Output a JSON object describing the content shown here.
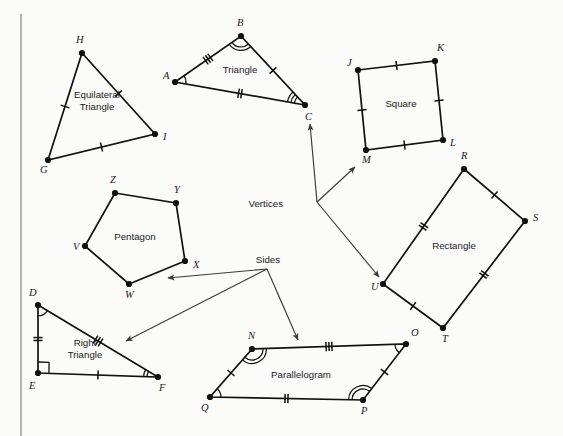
{
  "figure": {
    "background_color": "#fbfbfa",
    "ink_color": "#111111",
    "leader_color": "#3a3a3a",
    "border_rule_color": "#8c8c8c"
  },
  "shapes": [
    {
      "id": "equilateral-triangle",
      "name": "Equilateral Triangle",
      "label_lines": [
        "Equilateral",
        "Triangle"
      ],
      "label_pos": {
        "x": 97,
        "y": 104
      },
      "vertices": [
        {
          "label": "H",
          "x": 82,
          "y": 53,
          "lx": 76,
          "ly": 43
        },
        {
          "label": "I",
          "x": 155,
          "y": 134,
          "lx": 163,
          "ly": 140
        },
        {
          "label": "G",
          "x": 48,
          "y": 160,
          "lx": 40,
          "ly": 173
        }
      ],
      "side_ticks": [
        1,
        1,
        1
      ],
      "angle_marks": []
    },
    {
      "id": "triangle",
      "name": "Triangle",
      "label_lines": [
        "Triangle"
      ],
      "label_pos": {
        "x": 240,
        "y": 73
      },
      "vertices": [
        {
          "label": "A",
          "x": 175,
          "y": 82,
          "lx": 163,
          "ly": 79
        },
        {
          "label": "B",
          "x": 241,
          "y": 36,
          "lx": 237,
          "ly": 26
        },
        {
          "label": "C",
          "x": 305,
          "y": 105,
          "lx": 305,
          "ly": 120
        }
      ],
      "side_ticks": [
        3,
        1,
        2
      ],
      "angle_marks": [
        {
          "at": "A",
          "arcs": 1
        },
        {
          "at": "B",
          "arcs": 2
        },
        {
          "at": "C",
          "arcs": 3
        }
      ]
    },
    {
      "id": "square",
      "name": "Square",
      "label_lines": [
        "Square"
      ],
      "label_pos": {
        "x": 401,
        "y": 107
      },
      "vertices": [
        {
          "label": "J",
          "x": 358,
          "y": 70,
          "lx": 347,
          "ly": 66
        },
        {
          "label": "K",
          "x": 435,
          "y": 61,
          "lx": 437,
          "ly": 51
        },
        {
          "label": "L",
          "x": 443,
          "y": 140,
          "lx": 450,
          "ly": 146
        },
        {
          "label": "M",
          "x": 366,
          "y": 150,
          "lx": 362,
          "ly": 163
        }
      ],
      "side_ticks": [
        1,
        1,
        1,
        1
      ],
      "angle_marks": []
    },
    {
      "id": "rectangle",
      "name": "Rectangle",
      "label_lines": [
        "Rectangle"
      ],
      "label_pos": {
        "x": 454,
        "y": 249
      },
      "vertices": [
        {
          "label": "R",
          "x": 464,
          "y": 169,
          "lx": 461,
          "ly": 159
        },
        {
          "label": "S",
          "x": 525,
          "y": 221,
          "lx": 533,
          "ly": 221
        },
        {
          "label": "T",
          "x": 443,
          "y": 328,
          "lx": 442,
          "ly": 342
        },
        {
          "label": "U",
          "x": 383,
          "y": 284,
          "lx": 371,
          "ly": 290
        }
      ],
      "side_ticks": [
        1,
        2,
        1,
        2
      ],
      "angle_marks": []
    },
    {
      "id": "pentagon",
      "name": "Pentagon",
      "label_lines": [
        "Pentagon"
      ],
      "label_pos": {
        "x": 135,
        "y": 240
      },
      "vertices": [
        {
          "label": "Z",
          "x": 115,
          "y": 193,
          "lx": 110,
          "ly": 183
        },
        {
          "label": "Y",
          "x": 176,
          "y": 203,
          "lx": 174,
          "ly": 193
        },
        {
          "label": "X",
          "x": 185,
          "y": 261,
          "lx": 193,
          "ly": 268
        },
        {
          "label": "W",
          "x": 129,
          "y": 284,
          "lx": 125,
          "ly": 298
        },
        {
          "label": "V",
          "x": 85,
          "y": 246,
          "lx": 73,
          "ly": 250
        }
      ],
      "side_ticks": [
        0,
        0,
        0,
        0,
        0
      ],
      "angle_marks": []
    },
    {
      "id": "right-triangle",
      "name": "Right Triangle",
      "label_lines": [
        "Right",
        "Triangle"
      ],
      "label_pos": {
        "x": 85,
        "y": 352
      },
      "vertices": [
        {
          "label": "D",
          "x": 38,
          "y": 305,
          "lx": 29,
          "ly": 296
        },
        {
          "label": "F",
          "x": 158,
          "y": 377,
          "lx": 159,
          "ly": 391
        },
        {
          "label": "E",
          "x": 38,
          "y": 373,
          "lx": 29,
          "ly": 389
        }
      ],
      "side_ticks": [
        3,
        1,
        2
      ],
      "angle_marks": [
        {
          "at": "D",
          "arcs": 1
        },
        {
          "at": "F",
          "arcs": 2
        },
        {
          "at": "E",
          "arcs": 0,
          "right_angle": true
        }
      ]
    },
    {
      "id": "parallelogram",
      "name": "Parallelogram",
      "label_lines": [
        "Parallelogram"
      ],
      "label_pos": {
        "x": 301,
        "y": 378
      },
      "vertices": [
        {
          "label": "N",
          "x": 252,
          "y": 349,
          "lx": 248,
          "ly": 339
        },
        {
          "label": "O",
          "x": 406,
          "y": 344,
          "lx": 411,
          "ly": 336
        },
        {
          "label": "P",
          "x": 363,
          "y": 400,
          "lx": 361,
          "ly": 414
        },
        {
          "label": "Q",
          "x": 210,
          "y": 397,
          "lx": 201,
          "ly": 411
        }
      ],
      "side_ticks": [
        3,
        1,
        2,
        1
      ],
      "angle_marks": [
        {
          "at": "N",
          "arcs": 2
        },
        {
          "at": "O",
          "arcs": 1
        },
        {
          "at": "P",
          "arcs": 2
        },
        {
          "at": "Q",
          "arcs": 1
        }
      ]
    }
  ],
  "annotations": [
    {
      "id": "vertices-annotation",
      "label": "Vertices",
      "label_pos": {
        "x": 283,
        "y": 207
      },
      "origin": {
        "x": 317,
        "y": 202
      },
      "arrows": [
        {
          "to": {
            "x": 310,
            "y": 124
          },
          "target": "vertex-C"
        },
        {
          "to": {
            "x": 355,
            "y": 167
          },
          "target": "vertex-M"
        },
        {
          "to": {
            "x": 379,
            "y": 277
          },
          "target": "vertex-U"
        }
      ]
    },
    {
      "id": "sides-annotation",
      "label": "Sides",
      "label_pos": {
        "x": 280,
        "y": 263
      },
      "origin": {
        "x": 267,
        "y": 269
      },
      "arrows": [
        {
          "to": {
            "x": 168,
            "y": 278
          },
          "target": "pentagon-side-WX"
        },
        {
          "to": {
            "x": 126,
            "y": 341
          },
          "target": "right-triangle-hypotenuse-DF"
        },
        {
          "to": {
            "x": 298,
            "y": 340
          },
          "target": "parallelogram-side-NO"
        }
      ]
    }
  ]
}
